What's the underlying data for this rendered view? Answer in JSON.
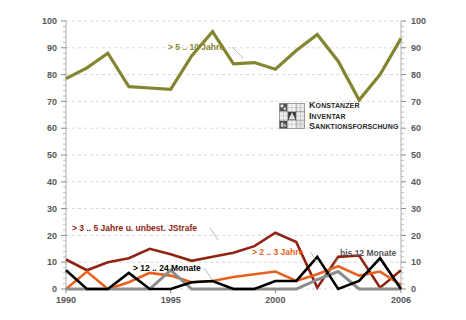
{
  "chart_data": {
    "type": "line",
    "title": "",
    "subtitle": "",
    "xlabel": "",
    "ylabel": "",
    "xlim": [
      1990,
      2006
    ],
    "ylim": [
      0,
      100
    ],
    "ytick_step": 10,
    "yticks": [
      "0",
      "10",
      "20",
      "30",
      "40",
      "50",
      "60",
      "70",
      "80",
      "90",
      "100"
    ],
    "xticks": [
      "1990",
      "1995",
      "2000",
      "2006"
    ],
    "xtick_values": [
      1990,
      1995,
      2000,
      2006
    ],
    "x": [
      1990,
      1991,
      1992,
      1993,
      1994,
      1995,
      1996,
      1997,
      1998,
      1999,
      2000,
      2001,
      2002,
      2003,
      2004,
      2005,
      2006
    ],
    "grid": "horizontal-dashed",
    "legend_position": "inline-annotations",
    "dual_y_axis": true,
    "series": [
      {
        "name": "> 5 .. 10 Jahre",
        "color": "#848530",
        "width": 3.2,
        "values": [
          78.5,
          82.5,
          88,
          75.5,
          75,
          74.5,
          87,
          96,
          84,
          84.5,
          82,
          89,
          95,
          85,
          70.5,
          80,
          93.5
        ]
      },
      {
        "name": "> 3 .. 5 Jahre u. unbest. JStrafe",
        "color": "#8e2411",
        "width": 2.6,
        "values": [
          11,
          7,
          10,
          11.5,
          15,
          13,
          10.5,
          12,
          13.5,
          16,
          21,
          17.5,
          0.5,
          12,
          12.5,
          0.5,
          7
        ]
      },
      {
        "name": "> 2 .. 3 Jahre",
        "color": "#e8601d",
        "width": 2.6,
        "values": [
          0,
          6.5,
          0,
          2.5,
          6,
          5,
          2.5,
          3,
          4.5,
          5.5,
          6.5,
          3,
          5.5,
          8.5,
          5,
          6.5,
          1.5
        ]
      },
      {
        "name": "> 12 .. 24 Monate",
        "color": "#000000",
        "width": 2.6,
        "values": [
          7,
          0,
          0,
          6,
          0,
          0,
          2.5,
          3,
          0,
          0,
          3,
          3,
          12,
          0,
          3,
          11.5,
          0
        ]
      },
      {
        "name": "bis  12 Monate",
        "color": "#8c8c8c",
        "width": 3.0,
        "values": [
          0,
          0,
          0,
          0,
          0,
          7,
          0,
          0,
          0,
          0,
          0,
          0,
          3.5,
          6.5,
          0,
          0,
          0
        ]
      }
    ],
    "annotations": [
      {
        "text": "> 5 .. 10 Jahre",
        "color": "#848530"
      },
      {
        "text": "> 3 .. 5 Jahre u. unbest. JStrafe",
        "color": "#8e2411"
      },
      {
        "text": "> 12 .. 24 Monate",
        "color": "#000000"
      },
      {
        "text": "> 2 .. 3 Jahre",
        "color": "#e8601d"
      },
      {
        "text": "bis  12 Monate",
        "color": "#58585a"
      }
    ]
  },
  "logo": {
    "mark_name": "konstanzer-inventar-logo-mark",
    "line1": "Konstanzer",
    "line2": "Inventar",
    "line3": "Sanktionsforschung"
  },
  "colors": {
    "series_green": "#848530",
    "series_darkred": "#8e2411",
    "series_orange": "#e8601d",
    "series_black": "#000000",
    "series_gray": "#8c8c8c",
    "axis_text": "#58585a",
    "gridline": "#c9c9cf",
    "background": "#ffffff"
  }
}
